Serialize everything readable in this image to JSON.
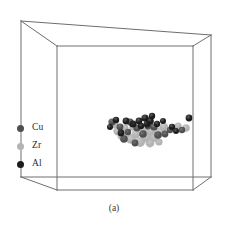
{
  "figure": {
    "caption": "(a)",
    "background_color": "#ffffff",
    "box": {
      "name": "simulation-cell",
      "edge_color": "#6e6e6e",
      "edge_width": 1,
      "vertices": {
        "back_top_left": [
          21,
          21
        ],
        "back_top_right": [
          211,
          35
        ],
        "front_top_left": [
          57,
          46
        ],
        "front_top_right": [
          193,
          46
        ],
        "back_bottom_left": [
          21,
          177
        ],
        "back_bottom_right": [
          211,
          177
        ],
        "front_bottom_left": [
          57,
          190
        ],
        "front_bottom_right": [
          193,
          190
        ]
      }
    },
    "legend": {
      "name": "species-legend",
      "items": [
        {
          "label": "Cu",
          "color": "#4f4f4f"
        },
        {
          "label": "Zr",
          "color": "#b4b4b4"
        },
        {
          "label": "Al",
          "color": "#1c1c1c"
        }
      ]
    }
  },
  "chart_data": {
    "type": "scatter",
    "title": "",
    "subtitle": "",
    "xlabel": "",
    "ylabel": "",
    "annotations": [
      "(a)"
    ],
    "legend_position": "left",
    "grid": false,
    "species_colors": {
      "Cu": "#4f4f4f",
      "Zr": "#b4b4b4",
      "Al": "#1c1c1c"
    },
    "axis_ranges": {
      "x": [
        0,
        228
      ],
      "y": [
        0,
        229
      ]
    },
    "series": [
      {
        "name": "Zr",
        "color": "#b4b4b4",
        "points": [
          {
            "x": 114,
            "y": 124,
            "r": 4.2
          },
          {
            "x": 118,
            "y": 131,
            "r": 4.6
          },
          {
            "x": 122,
            "y": 136,
            "r": 4.4
          },
          {
            "x": 127,
            "y": 133,
            "r": 4.0
          },
          {
            "x": 131,
            "y": 139,
            "r": 4.8
          },
          {
            "x": 136,
            "y": 134,
            "r": 4.2
          },
          {
            "x": 140,
            "y": 142,
            "r": 5.0
          },
          {
            "x": 146,
            "y": 137,
            "r": 5.2
          },
          {
            "x": 151,
            "y": 131,
            "r": 4.6
          },
          {
            "x": 155,
            "y": 137,
            "r": 5.0
          },
          {
            "x": 160,
            "y": 132,
            "r": 4.8
          },
          {
            "x": 150,
            "y": 143,
            "r": 4.4
          },
          {
            "x": 144,
            "y": 129,
            "r": 4.0
          },
          {
            "x": 133,
            "y": 127,
            "r": 3.8
          },
          {
            "x": 164,
            "y": 127,
            "r": 4.2
          },
          {
            "x": 178,
            "y": 126,
            "r": 3.6
          },
          {
            "x": 186,
            "y": 128,
            "r": 3.8
          },
          {
            "x": 125,
            "y": 128,
            "r": 3.4
          },
          {
            "x": 159,
            "y": 142,
            "r": 3.6
          }
        ]
      },
      {
        "name": "Cu",
        "color": "#4f4f4f",
        "points": [
          {
            "x": 112,
            "y": 122,
            "r": 3.6
          },
          {
            "x": 120,
            "y": 127,
            "r": 3.4
          },
          {
            "x": 124,
            "y": 139,
            "r": 3.8
          },
          {
            "x": 130,
            "y": 122,
            "r": 3.4
          },
          {
            "x": 137,
            "y": 128,
            "r": 3.6
          },
          {
            "x": 143,
            "y": 134,
            "r": 3.8
          },
          {
            "x": 148,
            "y": 126,
            "r": 3.4
          },
          {
            "x": 154,
            "y": 127,
            "r": 3.6
          },
          {
            "x": 158,
            "y": 135,
            "r": 3.8
          },
          {
            "x": 165,
            "y": 134,
            "r": 3.4
          },
          {
            "x": 170,
            "y": 130,
            "r": 3.2
          },
          {
            "x": 182,
            "y": 130,
            "r": 3.2
          },
          {
            "x": 135,
            "y": 143,
            "r": 3.4
          },
          {
            "x": 128,
            "y": 132,
            "r": 3.2
          }
        ]
      },
      {
        "name": "Al",
        "color": "#1c1c1c",
        "points": [
          {
            "x": 116,
            "y": 120,
            "r": 3.2
          },
          {
            "x": 126,
            "y": 121,
            "r": 3.4
          },
          {
            "x": 133,
            "y": 124,
            "r": 3.6
          },
          {
            "x": 139,
            "y": 121,
            "r": 3.4
          },
          {
            "x": 145,
            "y": 118,
            "r": 3.6
          },
          {
            "x": 150,
            "y": 121,
            "r": 3.8
          },
          {
            "x": 152,
            "y": 116,
            "r": 3.2
          },
          {
            "x": 147,
            "y": 124,
            "r": 3.4
          },
          {
            "x": 157,
            "y": 124,
            "r": 3.2
          },
          {
            "x": 163,
            "y": 121,
            "r": 3.0
          },
          {
            "x": 172,
            "y": 127,
            "r": 3.2
          },
          {
            "x": 176,
            "y": 131,
            "r": 3.0
          },
          {
            "x": 189,
            "y": 118,
            "r": 3.4
          },
          {
            "x": 121,
            "y": 133,
            "r": 3.4
          },
          {
            "x": 110,
            "y": 127,
            "r": 3.0
          },
          {
            "x": 141,
            "y": 126,
            "r": 3.2
          }
        ]
      }
    ]
  }
}
